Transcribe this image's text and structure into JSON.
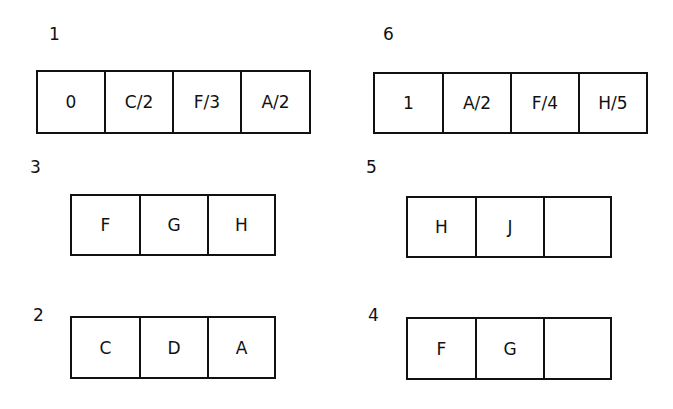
{
  "nodes": [
    {
      "id": "1",
      "cells": [
        "0",
        "C/2",
        "F/3",
        "A/2"
      ]
    },
    {
      "id": "6",
      "cells": [
        "1",
        "A/2",
        "F/4",
        "H/5"
      ]
    },
    {
      "id": "3",
      "cells": [
        "F",
        "G",
        "H"
      ]
    },
    {
      "id": "5",
      "cells": [
        "H",
        "J",
        ""
      ]
    },
    {
      "id": "2",
      "cells": [
        "C",
        "D",
        "A"
      ]
    },
    {
      "id": "4",
      "cells": [
        "F",
        "G",
        ""
      ]
    }
  ]
}
